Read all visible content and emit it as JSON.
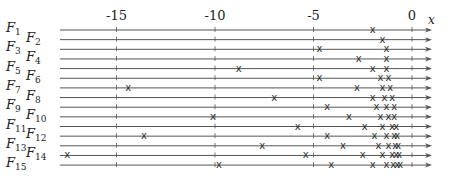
{
  "diagram": {
    "axis": {
      "label": "x",
      "ticks": [
        {
          "value": -15,
          "label": "-15"
        },
        {
          "value": -10,
          "label": "-10"
        },
        {
          "value": -5,
          "label": "-5"
        },
        {
          "value": 0,
          "label": "0"
        }
      ],
      "range": [
        -17.5,
        1
      ]
    },
    "marker_glyph": "x",
    "rows": [
      {
        "name": "F",
        "sub": "1",
        "points": [
          -2.0
        ]
      },
      {
        "name": "F",
        "sub": "2",
        "points": [
          -1.5
        ]
      },
      {
        "name": "F",
        "sub": "3",
        "points": [
          -4.7,
          -1.3
        ]
      },
      {
        "name": "F",
        "sub": "4",
        "points": [
          -2.7,
          -1.3
        ]
      },
      {
        "name": "F",
        "sub": "5",
        "points": [
          -8.8,
          -2.0,
          -1.3
        ]
      },
      {
        "name": "F",
        "sub": "6",
        "points": [
          -4.7,
          -1.6,
          -1.2
        ]
      },
      {
        "name": "F",
        "sub": "7",
        "points": [
          -14.4,
          -2.8,
          -1.5,
          -1.1
        ]
      },
      {
        "name": "F",
        "sub": "8",
        "points": [
          -7.0,
          -2.0,
          -1.4,
          -1.0
        ]
      },
      {
        "name": "F",
        "sub": "9",
        "points": [
          -4.3,
          -1.8,
          -1.3,
          -0.9
        ]
      },
      {
        "name": "F",
        "sub": "10",
        "points": [
          -10.1,
          -3.2,
          -1.6,
          -1.2,
          -0.9
        ]
      },
      {
        "name": "F",
        "sub": "11",
        "points": [
          -5.8,
          -2.4,
          -1.5,
          -1.0,
          -0.8
        ]
      },
      {
        "name": "F",
        "sub": "12",
        "points": [
          -13.6,
          -4.3,
          -1.9,
          -1.3,
          -0.9,
          -0.75
        ]
      },
      {
        "name": "F",
        "sub": "13",
        "points": [
          -7.6,
          -3.5,
          -1.7,
          -1.2,
          -0.85,
          -0.7
        ]
      },
      {
        "name": "F",
        "sub": "14",
        "points": [
          -17.5,
          -5.4,
          -2.5,
          -1.5,
          -1.0,
          -0.8,
          -0.65
        ]
      },
      {
        "name": "F",
        "sub": "15",
        "points": [
          -9.8,
          -4.1,
          -2.0,
          -1.3,
          -0.95,
          -0.75,
          -0.6
        ]
      }
    ]
  }
}
